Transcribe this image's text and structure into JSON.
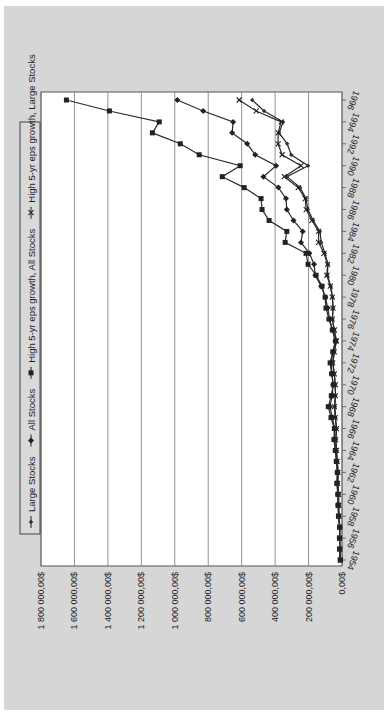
{
  "chart_data": {
    "type": "line",
    "orientation": "rotated-90-counterclockwise",
    "title": "",
    "xlabel": "",
    "ylabel": "",
    "ylim": [
      0,
      1800000
    ],
    "y_ticks": [
      0,
      200000,
      400000,
      600000,
      800000,
      1000000,
      1200000,
      1400000,
      1600000,
      1800000
    ],
    "y_tick_labels": [
      "0,00$",
      "200 000,00$",
      "400 000,00$",
      "600 000,00$",
      "800 000,00$",
      "1 000 000,00$",
      "1 200 000,00$",
      "1 400 000,00$",
      "1 600 000,00$",
      "1 800 000,00$"
    ],
    "x_tick_labels": [
      "1954",
      "1956",
      "1958",
      "1960",
      "1962",
      "1964",
      "1966",
      "1968",
      "1970",
      "1972",
      "1974",
      "1976",
      "1978",
      "1980",
      "1982",
      "1984",
      "1986",
      "1988",
      "1990",
      "1992",
      "1994",
      "1996"
    ],
    "x": [
      1954,
      1955,
      1956,
      1957,
      1958,
      1959,
      1960,
      1961,
      1962,
      1963,
      1964,
      1965,
      1966,
      1967,
      1968,
      1969,
      1970,
      1971,
      1972,
      1973,
      1974,
      1975,
      1976,
      1977,
      1978,
      1979,
      1980,
      1981,
      1982,
      1983,
      1984,
      1985,
      1986,
      1987,
      1988,
      1989,
      1990,
      1991,
      1992,
      1993,
      1994,
      1995,
      1996
    ],
    "grid": true,
    "legend_position": "top",
    "series": [
      {
        "name": "Large Stocks",
        "marker": "diamond-small",
        "values": [
          10000,
          13000,
          14000,
          13000,
          18000,
          20000,
          20000,
          25000,
          23000,
          28000,
          32000,
          36000,
          32000,
          38000,
          42000,
          39000,
          40000,
          46000,
          54000,
          46000,
          34000,
          46000,
          57000,
          53000,
          57000,
          67000,
          88000,
          84000,
          102000,
          124000,
          132000,
          172000,
          204000,
          215000,
          250000,
          329000,
          203000,
          304000,
          328000,
          376000,
          352000,
          466000,
          537000
        ]
      },
      {
        "name": "All Stocks",
        "marker": "diamond",
        "values": [
          10000,
          14000,
          15000,
          14000,
          20000,
          23000,
          24000,
          29000,
          27000,
          33000,
          38000,
          45000,
          43000,
          58000,
          72000,
          59000,
          53000,
          60000,
          65000,
          54000,
          40000,
          56000,
          75000,
          85000,
          99000,
          125000,
          160000,
          167000,
          195000,
          245000,
          235000,
          290000,
          330000,
          335000,
          380000,
          470000,
          394000,
          519000,
          567000,
          657000,
          651000,
          830000,
          985000
        ]
      },
      {
        "name": "High 5-yr eps growth, All Stocks",
        "marker": "square",
        "values": [
          10000,
          14000,
          15000,
          14000,
          21000,
          24000,
          25000,
          31000,
          28000,
          34000,
          40000,
          48000,
          46000,
          66000,
          82000,
          64000,
          52000,
          62000,
          71000,
          55000,
          38000,
          58000,
          78000,
          96000,
          101000,
          119000,
          155000,
          203000,
          215000,
          340000,
          330000,
          436000,
          478000,
          484000,
          585000,
          716000,
          609000,
          854000,
          967000,
          1134000,
          1093000,
          1391000,
          1648000
        ]
      },
      {
        "name": "High 5-yr eps growth, Large Stocks",
        "marker": "cross",
        "values": [
          10000,
          13000,
          14000,
          13000,
          18000,
          20000,
          21000,
          26000,
          24000,
          29000,
          33000,
          38000,
          33000,
          41000,
          46000,
          40000,
          40000,
          46000,
          56000,
          46000,
          33000,
          46000,
          58000,
          54000,
          58000,
          70000,
          90000,
          86000,
          108000,
          140000,
          140000,
          180000,
          214000,
          220000,
          262000,
          345000,
          245000,
          358000,
          382000,
          382000,
          364000,
          513000,
          615000
        ]
      }
    ]
  }
}
